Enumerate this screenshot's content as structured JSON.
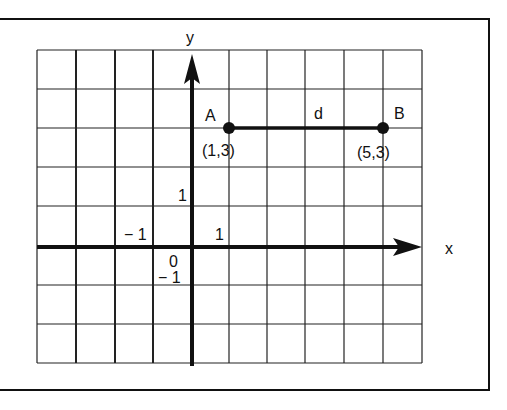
{
  "diagram": {
    "axes": {
      "x_label": "x",
      "y_label": "y"
    },
    "ticks": {
      "x_pos": "1",
      "x_neg": "− 1",
      "y_pos": "1",
      "y_neg": "− 1",
      "origin": "0"
    },
    "points": [
      {
        "name": "A",
        "coord_label": "(1,3)",
        "x": 1,
        "y": 3
      },
      {
        "name": "B",
        "coord_label": "(5,3)",
        "x": 5,
        "y": 3
      }
    ],
    "segment": {
      "label": "d",
      "from": "A",
      "to": "B"
    },
    "grid": {
      "x_min": -4,
      "x_max": 6,
      "y_min": -3,
      "y_max": 5
    }
  }
}
